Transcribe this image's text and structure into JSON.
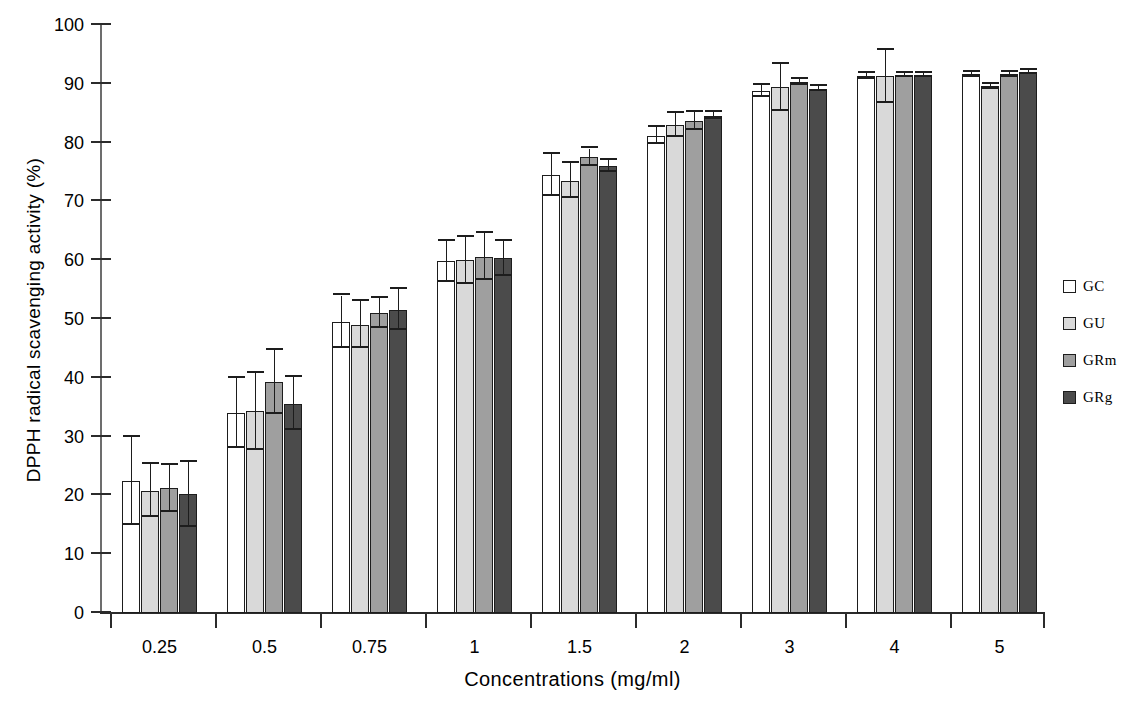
{
  "chart_data": {
    "type": "bar",
    "title": "",
    "xlabel": "Concentrations (mg/ml)",
    "ylabel": "DPPH radical scavenging activity (%)",
    "categories": [
      "0.25",
      "0.5",
      "0.75",
      "1",
      "1.5",
      "2",
      "3",
      "4",
      "5"
    ],
    "ylim": [
      0,
      100
    ],
    "ytick_labels": [
      "0",
      "10",
      "20",
      "30",
      "40",
      "50",
      "60",
      "70",
      "80",
      "90",
      "100"
    ],
    "ytick_values": [
      0,
      10,
      20,
      30,
      40,
      50,
      60,
      70,
      80,
      90,
      100
    ],
    "grid": false,
    "legend_position": "right",
    "series": [
      {
        "name": "GC",
        "color": "#ffffff",
        "values": [
          22.5,
          34.0,
          49.5,
          59.8,
          74.5,
          81.2,
          88.8,
          91.3,
          91.6
        ],
        "errors": [
          7.5,
          6.0,
          4.5,
          3.5,
          3.5,
          1.5,
          1.0,
          0.5,
          0.4
        ]
      },
      {
        "name": "GU",
        "color": "#d9d9d9",
        "values": [
          20.8,
          34.3,
          49.0,
          60.0,
          73.5,
          83.0,
          89.4,
          91.3,
          89.6
        ],
        "errors": [
          4.5,
          6.5,
          4.0,
          4.0,
          3.0,
          2.0,
          4.0,
          4.5,
          0.4
        ]
      },
      {
        "name": "GRm",
        "color": "#9f9f9f",
        "values": [
          21.2,
          39.3,
          51.0,
          60.6,
          77.5,
          83.7,
          90.3,
          91.5,
          91.6
        ],
        "errors": [
          4.0,
          5.5,
          2.5,
          4.0,
          1.5,
          1.5,
          0.5,
          0.4,
          0.4
        ]
      },
      {
        "name": "GRg",
        "color": "#4b4b4b",
        "values": [
          20.2,
          35.6,
          51.6,
          60.3,
          76.0,
          84.6,
          89.2,
          91.5,
          92.0
        ],
        "errors": [
          5.5,
          4.5,
          3.5,
          3.0,
          1.0,
          0.6,
          0.5,
          0.4,
          0.4
        ]
      }
    ]
  },
  "legend": {
    "items": [
      {
        "label": "GC"
      },
      {
        "label": "GU"
      },
      {
        "label": "GRm"
      },
      {
        "label": "GRg"
      }
    ]
  },
  "axes": {
    "y_title": "DPPH radical scavenging activity (%)",
    "x_title": "Concentrations (mg/ml)"
  }
}
